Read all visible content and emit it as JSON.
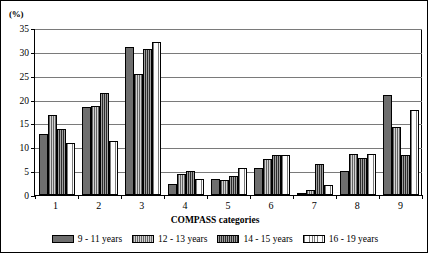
{
  "chart_data": {
    "type": "bar",
    "title": "",
    "subtitle": "",
    "xlabel": "COMPASS categories",
    "ylabel": "",
    "y_unit_label": "(%)",
    "ylim": [
      0,
      35
    ],
    "ytick_step": 5,
    "yticks": [
      0,
      5,
      10,
      15,
      20,
      25,
      30,
      35
    ],
    "ytick_labels": [
      "0",
      "5",
      "10",
      "15",
      "20",
      "25",
      "30",
      "35"
    ],
    "grid": true,
    "grid_axis": "y",
    "legend_position": "bottom",
    "categories": [
      "1",
      "2",
      "3",
      "4",
      "5",
      "6",
      "7",
      "8",
      "9"
    ],
    "series": [
      {
        "name": "9 - 11 years",
        "color": "#6e6e6e",
        "pattern": "solid-gray",
        "values": [
          12.7,
          18.5,
          31.0,
          2.3,
          3.4,
          5.7,
          0.4,
          5.0,
          21.0
        ]
      },
      {
        "name": "12 - 13 years",
        "color": "#d2d2d2",
        "pattern": "light-gray-vertical-lines",
        "values": [
          16.7,
          18.7,
          25.4,
          4.3,
          3.1,
          7.6,
          1.1,
          8.5,
          14.3
        ]
      },
      {
        "name": "14 - 15 years",
        "color": "#2b2b2b",
        "pattern": "dark-vertical-lines",
        "values": [
          13.8,
          21.4,
          30.7,
          5.1,
          3.9,
          8.4,
          6.6,
          7.8,
          8.4
        ]
      },
      {
        "name": "16 - 19 years",
        "color": "#fdfdfd",
        "pattern": "white-dotted-vertical-lines",
        "values": [
          11.0,
          11.3,
          32.0,
          3.4,
          5.6,
          8.4,
          2.0,
          8.5,
          17.8
        ]
      }
    ]
  }
}
